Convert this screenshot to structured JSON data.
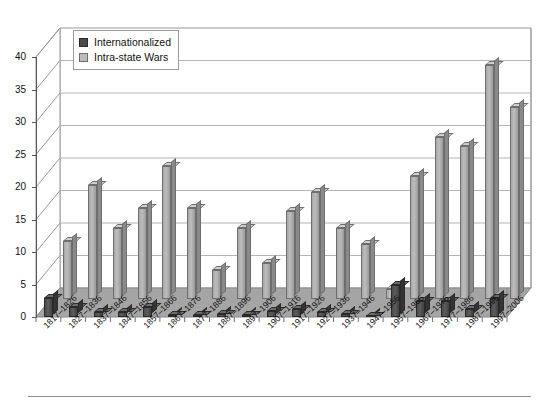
{
  "chart_data": {
    "type": "bar",
    "title": "",
    "xlabel": "",
    "ylabel": "",
    "ylim": [
      0,
      40
    ],
    "ytick_step": 5,
    "yticks": [
      0,
      5,
      10,
      15,
      20,
      25,
      30,
      35,
      40
    ],
    "grid": true,
    "three_d": true,
    "legend_position": "top-left",
    "categories": [
      "1817–1826",
      "1827–1836",
      "1837–1846",
      "1847–1856",
      "1857–1866",
      "1867–1876",
      "1877–1886",
      "1887–1896",
      "1897–1906",
      "1907–1916",
      "1917–1926",
      "1927–1936",
      "1937–1946",
      "1947–1956",
      "1957–1966",
      "1967–1976",
      "1977–1986",
      "1987–1996",
      "1997–2006"
    ],
    "series": [
      {
        "name": "Internationalized",
        "color": "#4a4a4a",
        "values": [
          3,
          1.5,
          0.8,
          0.8,
          1.5,
          0.3,
          0.3,
          0.5,
          0.3,
          1,
          1.3,
          0.8,
          0.5,
          0.2,
          5,
          2.5,
          2.5,
          1.2,
          3
        ]
      },
      {
        "name": "Intra-state Wars",
        "color": "#bdbdbd",
        "values": [
          9,
          17.5,
          11,
          14,
          20.5,
          14,
          4.5,
          11,
          5.5,
          13.5,
          16.5,
          11,
          8.5,
          1.5,
          19,
          25,
          23.5,
          36,
          29.5
        ]
      }
    ]
  },
  "legend": {
    "items": [
      {
        "label": "Internationalized",
        "swatch": "dark-sw"
      },
      {
        "label": "Intra-state Wars",
        "swatch": "light-sw"
      }
    ]
  },
  "footer": {
    "rule": true,
    "caption": ""
  }
}
